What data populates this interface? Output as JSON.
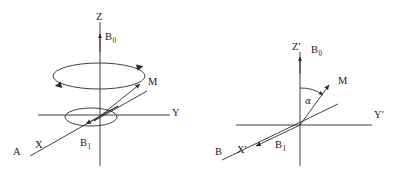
{
  "figure": {
    "background_color": "#ffffff",
    "stroke_color": "#2b2b2b",
    "panels": [
      {
        "id": "panel-a",
        "panel_label": "A",
        "description": "Laboratory frame: magnetization M precessing about B0 along Z",
        "axes": [
          {
            "name": "z-axis",
            "label": "Z"
          },
          {
            "name": "y-axis",
            "label": "Y"
          },
          {
            "name": "x-axis",
            "label": "X"
          }
        ],
        "vectors": [
          {
            "name": "b0-vector",
            "label": "B",
            "subscript": "0"
          },
          {
            "name": "m-vector",
            "label": "M",
            "subscript": ""
          },
          {
            "name": "b1-vector",
            "label": "B",
            "subscript": "1"
          }
        ],
        "labels": {
          "z": "Z",
          "y": "Y",
          "x": "X",
          "b0": "B",
          "b0_sub": "0",
          "m": "M",
          "b1": "B",
          "b1_sub": "1",
          "panel": "A"
        }
      },
      {
        "id": "panel-b",
        "panel_label": "B",
        "description": "Rotating frame: magnetization M tipped by angle alpha from Z prime",
        "axes": [
          {
            "name": "z-prime-axis",
            "label": "Z'"
          },
          {
            "name": "y-prime-axis",
            "label": "Y'"
          },
          {
            "name": "x-prime-axis",
            "label": "X'"
          }
        ],
        "vectors": [
          {
            "name": "b0-vector",
            "label": "B",
            "subscript": "0"
          },
          {
            "name": "m-vector",
            "label": "M",
            "subscript": ""
          },
          {
            "name": "b1-vector",
            "label": "B",
            "subscript": "1"
          }
        ],
        "angle": {
          "name": "alpha-angle",
          "label": "α"
        },
        "labels": {
          "z": "Z'",
          "y": "Y'",
          "x": "X'",
          "b0": "B",
          "b0_sub": "0",
          "m": "M",
          "b1": "B",
          "b1_sub": "1",
          "alpha": "α",
          "panel": "B"
        }
      }
    ]
  }
}
